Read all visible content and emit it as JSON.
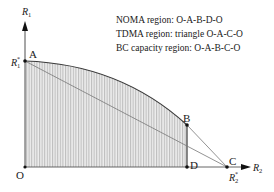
{
  "legend": {
    "noma": "NOMA region: O-A-B-D-O",
    "tdma": "TDMA region: triangle O-A-C-O",
    "bc": "BC capacity region: O-A-B-C-O"
  },
  "axes": {
    "y_label": "R",
    "y_sub": "1",
    "x_label": "R",
    "x_sub": "2",
    "y_intercept_label": "R",
    "y_intercept_sub": "1",
    "y_intercept_sup": "*",
    "x_intercept_label": "R",
    "x_intercept_sub": "2",
    "x_intercept_sup": "*"
  },
  "points": {
    "A": "A",
    "B": "B",
    "C": "C",
    "D": "D",
    "O": "O"
  },
  "colors": {
    "line": "#333333",
    "hatch": "#9a9a9a",
    "fill": "#e6e6e6",
    "chord": "#777777"
  }
}
